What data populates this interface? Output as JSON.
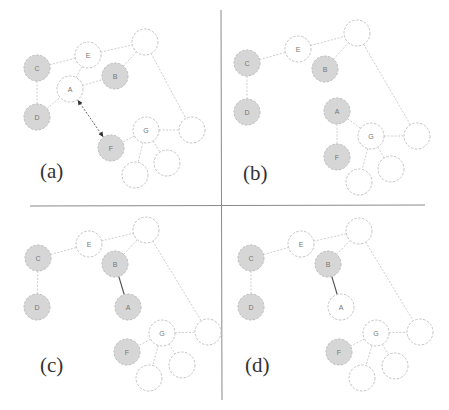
{
  "colors": {
    "filled_node": "#d6d6d6",
    "empty_node": "#ffffff",
    "node_border": "#c4c4c4",
    "edge": "#c8c8c8",
    "highlight_edge": "#555555",
    "divider": "#8a8a8a"
  },
  "radius": 13,
  "dividers": {
    "horizontal": {
      "x1": 30,
      "y1": 206,
      "x2": 425,
      "y2": 205
    },
    "vertical": {
      "x1": 221,
      "y1": 10,
      "x2": 222,
      "y2": 400
    }
  },
  "panels": [
    {
      "id": "a",
      "label": "(a)",
      "label_pos": [
        40,
        178
      ],
      "nodes": [
        {
          "id": "C",
          "label": "C",
          "x": 37,
          "y": 68,
          "filled": true
        },
        {
          "id": "E",
          "label": "E",
          "x": 88,
          "y": 55,
          "filled": false
        },
        {
          "id": "T",
          "label": "",
          "x": 145,
          "y": 42,
          "filled": false
        },
        {
          "id": "B",
          "label": "B",
          "x": 115,
          "y": 76,
          "filled": true
        },
        {
          "id": "A",
          "label": "A",
          "x": 70,
          "y": 89,
          "filled": false
        },
        {
          "id": "D",
          "label": "D",
          "x": 37,
          "y": 117,
          "filled": true
        },
        {
          "id": "R",
          "label": "",
          "x": 192,
          "y": 130,
          "filled": false
        },
        {
          "id": "G",
          "label": "G",
          "x": 146,
          "y": 130,
          "filled": false
        },
        {
          "id": "F",
          "label": "F",
          "x": 111,
          "y": 148,
          "filled": true
        },
        {
          "id": "BR",
          "label": "",
          "x": 167,
          "y": 163,
          "filled": false
        },
        {
          "id": "BL",
          "label": "",
          "x": 135,
          "y": 175,
          "filled": false
        }
      ],
      "edges": [
        [
          "C",
          "E"
        ],
        [
          "E",
          "T"
        ],
        [
          "E",
          "A"
        ],
        [
          "A",
          "B"
        ],
        [
          "B",
          "T"
        ],
        [
          "C",
          "D"
        ],
        [
          "D",
          "A"
        ],
        [
          "T",
          "R"
        ],
        [
          "G",
          "R"
        ],
        [
          "G",
          "F"
        ],
        [
          "G",
          "BR"
        ],
        [
          "G",
          "BL"
        ]
      ],
      "solid_edges": [],
      "arrows": [
        [
          "A",
          "F"
        ]
      ]
    },
    {
      "id": "b",
      "label": "(b)",
      "label_pos": [
        243,
        180
      ],
      "nodes": [
        {
          "id": "C",
          "label": "C",
          "x": 247,
          "y": 63,
          "filled": true
        },
        {
          "id": "E",
          "label": "E",
          "x": 298,
          "y": 49,
          "filled": false
        },
        {
          "id": "T",
          "label": "",
          "x": 357,
          "y": 33,
          "filled": false
        },
        {
          "id": "B",
          "label": "B",
          "x": 325,
          "y": 69,
          "filled": true
        },
        {
          "id": "D",
          "label": "D",
          "x": 247,
          "y": 112,
          "filled": true
        },
        {
          "id": "A",
          "label": "A",
          "x": 337,
          "y": 111,
          "filled": true
        },
        {
          "id": "G",
          "label": "G",
          "x": 371,
          "y": 136,
          "filled": false
        },
        {
          "id": "R",
          "label": "",
          "x": 417,
          "y": 136,
          "filled": false
        },
        {
          "id": "F",
          "label": "F",
          "x": 337,
          "y": 157,
          "filled": true
        },
        {
          "id": "BR",
          "label": "",
          "x": 391,
          "y": 169,
          "filled": false
        },
        {
          "id": "BL",
          "label": "",
          "x": 359,
          "y": 182,
          "filled": false
        }
      ],
      "edges": [
        [
          "C",
          "E"
        ],
        [
          "E",
          "T"
        ],
        [
          "B",
          "T"
        ],
        [
          "C",
          "D"
        ],
        [
          "T",
          "R"
        ],
        [
          "A",
          "G"
        ],
        [
          "A",
          "F"
        ],
        [
          "G",
          "R"
        ],
        [
          "G",
          "BR"
        ],
        [
          "G",
          "BL"
        ]
      ],
      "solid_edges": [],
      "arrows": []
    },
    {
      "id": "c",
      "label": "(c)",
      "label_pos": [
        40,
        372
      ],
      "nodes": [
        {
          "id": "C",
          "label": "C",
          "x": 38,
          "y": 258,
          "filled": true
        },
        {
          "id": "E",
          "label": "E",
          "x": 89,
          "y": 244,
          "filled": false
        },
        {
          "id": "T",
          "label": "",
          "x": 146,
          "y": 230,
          "filled": false
        },
        {
          "id": "B",
          "label": "B",
          "x": 115,
          "y": 264,
          "filled": true
        },
        {
          "id": "D",
          "label": "D",
          "x": 37,
          "y": 307,
          "filled": true
        },
        {
          "id": "A",
          "label": "A",
          "x": 128,
          "y": 307,
          "filled": true
        },
        {
          "id": "G",
          "label": "G",
          "x": 162,
          "y": 333,
          "filled": false
        },
        {
          "id": "R",
          "label": "",
          "x": 208,
          "y": 332,
          "filled": false
        },
        {
          "id": "F",
          "label": "F",
          "x": 127,
          "y": 352,
          "filled": true
        },
        {
          "id": "BR",
          "label": "",
          "x": 182,
          "y": 365,
          "filled": false
        },
        {
          "id": "BL",
          "label": "",
          "x": 149,
          "y": 378,
          "filled": false
        }
      ],
      "edges": [
        [
          "C",
          "E"
        ],
        [
          "E",
          "T"
        ],
        [
          "B",
          "T"
        ],
        [
          "C",
          "D"
        ],
        [
          "T",
          "R"
        ],
        [
          "G",
          "R"
        ],
        [
          "G",
          "F"
        ],
        [
          "G",
          "BR"
        ],
        [
          "G",
          "BL"
        ]
      ],
      "solid_edges": [
        [
          "B",
          "A"
        ]
      ],
      "arrows": []
    },
    {
      "id": "d",
      "label": "(d)",
      "label_pos": [
        245,
        372
      ],
      "nodes": [
        {
          "id": "C",
          "label": "C",
          "x": 251,
          "y": 258,
          "filled": true
        },
        {
          "id": "E",
          "label": "E",
          "x": 301,
          "y": 244,
          "filled": false
        },
        {
          "id": "T",
          "label": "",
          "x": 359,
          "y": 231,
          "filled": false
        },
        {
          "id": "B",
          "label": "B",
          "x": 328,
          "y": 264,
          "filled": true
        },
        {
          "id": "D",
          "label": "D",
          "x": 251,
          "y": 307,
          "filled": true
        },
        {
          "id": "A",
          "label": "A",
          "x": 341,
          "y": 307,
          "filled": false
        },
        {
          "id": "G",
          "label": "G",
          "x": 376,
          "y": 333,
          "filled": false
        },
        {
          "id": "R",
          "label": "",
          "x": 420,
          "y": 332,
          "filled": false
        },
        {
          "id": "F",
          "label": "F",
          "x": 339,
          "y": 352,
          "filled": true
        },
        {
          "id": "BR",
          "label": "",
          "x": 395,
          "y": 366,
          "filled": false
        },
        {
          "id": "BL",
          "label": "",
          "x": 362,
          "y": 378,
          "filled": false
        }
      ],
      "edges": [
        [
          "C",
          "E"
        ],
        [
          "E",
          "T"
        ],
        [
          "B",
          "T"
        ],
        [
          "C",
          "D"
        ],
        [
          "T",
          "R"
        ],
        [
          "G",
          "R"
        ],
        [
          "G",
          "F"
        ],
        [
          "G",
          "BR"
        ],
        [
          "G",
          "BL"
        ]
      ],
      "solid_edges": [
        [
          "B",
          "A"
        ]
      ],
      "arrows": []
    }
  ]
}
